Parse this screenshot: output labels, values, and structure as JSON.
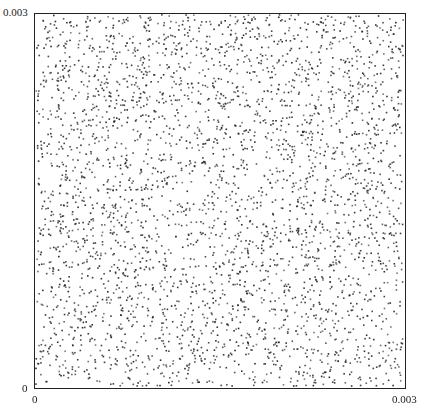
{
  "chart_data": {
    "type": "scatter",
    "title": "",
    "xlabel": "",
    "ylabel": "",
    "xlim": [
      0,
      0.003
    ],
    "ylim": [
      0,
      0.003
    ],
    "x_ticks": [
      "0",
      "0.003"
    ],
    "y_ticks": [
      "0",
      "0.003"
    ],
    "grid": false,
    "legend": null,
    "series": [
      {
        "name": "points",
        "distribution": "uniform random",
        "approx_count": 3600,
        "seed": 12345,
        "marker_size_px": 1.6,
        "color": "#2a2a2a"
      }
    ]
  },
  "axes": {
    "y_top_label": "0.003",
    "y_bottom_label": "0",
    "x_left_label": "0",
    "x_right_label": "0.003"
  }
}
